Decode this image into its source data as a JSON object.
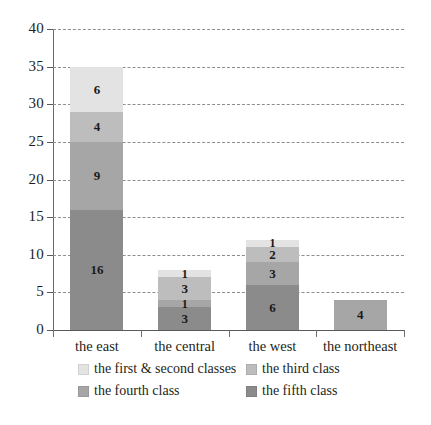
{
  "chart_data": {
    "type": "bar",
    "subtype": "stacked-vertical",
    "title": "",
    "xlabel": "",
    "ylabel": "",
    "ylim": [
      0,
      40
    ],
    "ytick_step": 5,
    "yticks": [
      "0",
      "5",
      "10",
      "15",
      "20",
      "25",
      "30",
      "35",
      "40"
    ],
    "grid": true,
    "grid_style": "dashed horizontal",
    "legend_position": "bottom",
    "categories": [
      "the east",
      "the central",
      "the west",
      "the northeast"
    ],
    "series": [
      {
        "name": "the first & second classes",
        "color": "#e3e3e3",
        "values": [
          6,
          1,
          1,
          0
        ],
        "labels": [
          "6",
          "1",
          "1",
          ""
        ]
      },
      {
        "name": "the third class",
        "color": "#bdbdbd",
        "values": [
          4,
          3,
          2,
          0
        ],
        "labels": [
          "4",
          "3",
          "2",
          ""
        ]
      },
      {
        "name": "the fourth class",
        "color": "#a6a6a6",
        "values": [
          9,
          1,
          3,
          4
        ],
        "labels": [
          "9",
          "1",
          "3",
          "4"
        ]
      },
      {
        "name": "the fifth class",
        "color": "#8b8b8b",
        "values": [
          16,
          3,
          6,
          0
        ],
        "labels": [
          "16",
          "3",
          "6",
          ""
        ]
      }
    ],
    "totals": [
      35,
      8,
      12,
      4
    ],
    "stack_order_top_to_bottom": [
      "the first & second classes",
      "the third class",
      "the fourth class",
      "the fifth class"
    ]
  },
  "axis": {
    "y_labels": [
      "40",
      "35",
      "30",
      "25",
      "20",
      "15",
      "10",
      "5",
      "0"
    ],
    "x_labels": [
      "the east",
      "the central",
      "the west",
      "the northeast"
    ]
  },
  "legend": {
    "items": [
      {
        "label": "the first & second classes",
        "color": "#e3e3e3"
      },
      {
        "label": "the third class",
        "color": "#bdbdbd"
      },
      {
        "label": "the fourth class",
        "color": "#a6a6a6"
      },
      {
        "label": "the fifth class",
        "color": "#8b8b8b"
      }
    ]
  },
  "colors": {
    "grid": "#8d8d8d",
    "axis": "#5a5a5a",
    "text": "#231f20",
    "background": "#ffffff"
  }
}
